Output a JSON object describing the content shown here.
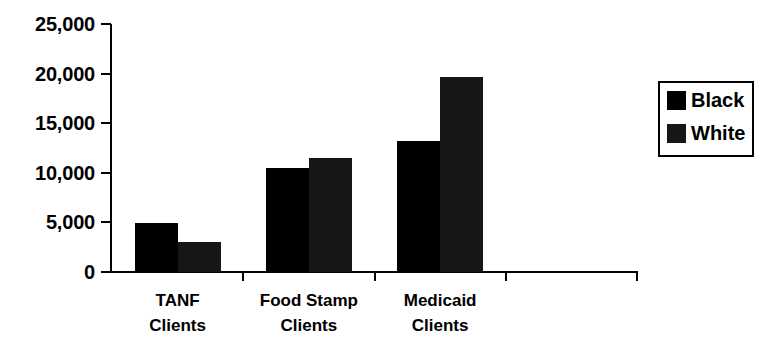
{
  "chart_data": {
    "type": "bar",
    "title": "",
    "subtitle": "",
    "xlabel": "",
    "ylabel": "",
    "categories": [
      "TANF Clients",
      "Food Stamp Clients",
      "Medicaid Clients"
    ],
    "category_lines": [
      [
        "TANF",
        "Clients"
      ],
      [
        "Food Stamp",
        "Clients"
      ],
      [
        "Medicaid",
        "Clients"
      ]
    ],
    "series": [
      {
        "name": "Black",
        "color": "#000000",
        "values": [
          4900,
          10450,
          13200
        ]
      },
      {
        "name": "White",
        "color": "#161616",
        "values": [
          3050,
          11450,
          19700
        ]
      }
    ],
    "ylim": [
      0,
      25000
    ],
    "ytick_values": [
      0,
      5000,
      10000,
      15000,
      20000,
      25000
    ],
    "ytick_labels": [
      "0",
      "5,000",
      "10,000",
      "15,000",
      "20,000",
      "25,000"
    ],
    "grid": false,
    "legend_position": "right",
    "empty_trailing_category": true
  },
  "legend": {
    "entries": [
      {
        "label": "Black",
        "swatch": "black-swatch"
      },
      {
        "label": "White",
        "swatch": "white-swatch"
      }
    ]
  },
  "axes": {
    "y_axis_name": "value-axis",
    "x_axis_name": "category-axis"
  }
}
